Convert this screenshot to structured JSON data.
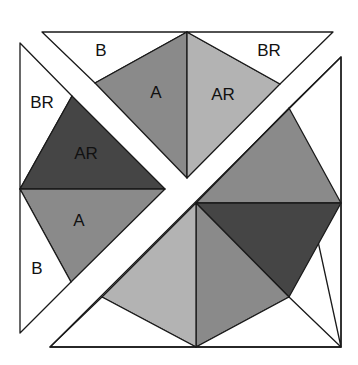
{
  "colors": {
    "white": "#ffffff",
    "medium": "#8a8a8a",
    "light": "#b3b3b3",
    "dark": "#454545"
  },
  "labels": {
    "top_B": "B",
    "top_A": "A",
    "top_AR": "AR",
    "top_BR": "BR",
    "left_BR": "BR",
    "left_AR": "AR",
    "left_A": "A",
    "left_B": "B"
  },
  "pieces": {
    "top_triangle": {
      "outline": "42,32 333,32 187,178",
      "B": "42,32 187,32 95,83",
      "A": "95,83 187,32 187,178",
      "AR": "187,32 280,84 187,178",
      "BR": "187,32 333,32 280,84"
    },
    "left_triangle": {
      "outline": "20,43 165,189 20,333",
      "BR": "20,43 72,96 20,189",
      "AR": "72,96 165,189 20,189",
      "A": "20,189 165,189 71,282",
      "B": "20,189 71,282 20,333"
    },
    "bottom_right_piece": {
      "outline": "341,57 341,347 50,347",
      "white_right": "341,57 341,347 289,108",
      "medium_top": "289,108 341,203 196,203",
      "dark": "196,203 341,203 289,297",
      "medium_lower": "196,203 289,297 196,347",
      "light": "196,203 196,347 102,297",
      "white_bottom_left": "102,297 196,347 50,347",
      "white_bottom_right": "196,347 289,297 341,347"
    }
  }
}
